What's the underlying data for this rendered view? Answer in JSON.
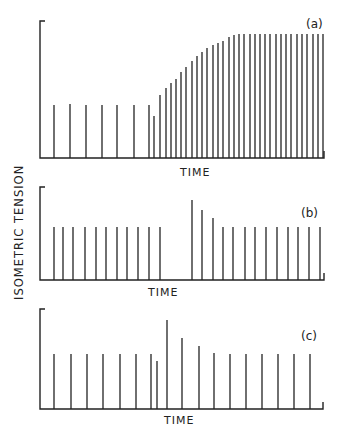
{
  "chart_data": {
    "type": "bar",
    "ylabel": "ISOMETRIC TENSION",
    "xlabel": "TIME",
    "grid": false,
    "panels": [
      {
        "label": "(a)",
        "xlabel": "TIME",
        "axis": {
          "x0": 40,
          "x1": 324,
          "baseline": 158,
          "top": 21
        },
        "label_pos": {
          "x": 306,
          "y": 28
        },
        "xlabel_pos": {
          "x": 180,
          "y": 176
        },
        "bars": [
          {
            "x": 54,
            "top": 105
          },
          {
            "x": 70,
            "top": 104
          },
          {
            "x": 86,
            "top": 105
          },
          {
            "x": 102,
            "top": 105
          },
          {
            "x": 117,
            "top": 105
          },
          {
            "x": 134,
            "top": 105
          },
          {
            "x": 149,
            "top": 105
          },
          {
            "x": 154,
            "top": 116
          },
          {
            "x": 160,
            "top": 95
          },
          {
            "x": 166,
            "top": 88
          },
          {
            "x": 171,
            "top": 83
          },
          {
            "x": 176,
            "top": 79
          },
          {
            "x": 181,
            "top": 72
          },
          {
            "x": 186,
            "top": 67
          },
          {
            "x": 192,
            "top": 61
          },
          {
            "x": 197,
            "top": 56
          },
          {
            "x": 202,
            "top": 52
          },
          {
            "x": 207,
            "top": 48
          },
          {
            "x": 213,
            "top": 45
          },
          {
            "x": 218,
            "top": 43
          },
          {
            "x": 223,
            "top": 41
          },
          {
            "x": 229,
            "top": 37
          },
          {
            "x": 234,
            "top": 35
          },
          {
            "x": 239,
            "top": 34
          },
          {
            "x": 244,
            "top": 34
          },
          {
            "x": 250,
            "top": 34
          },
          {
            "x": 255,
            "top": 34
          },
          {
            "x": 260,
            "top": 34
          },
          {
            "x": 265,
            "top": 34
          },
          {
            "x": 270,
            "top": 34
          },
          {
            "x": 276,
            "top": 34
          },
          {
            "x": 281,
            "top": 34
          },
          {
            "x": 286,
            "top": 34
          },
          {
            "x": 291,
            "top": 34
          },
          {
            "x": 297,
            "top": 34
          },
          {
            "x": 302,
            "top": 34
          },
          {
            "x": 307,
            "top": 34
          },
          {
            "x": 313,
            "top": 34
          },
          {
            "x": 318,
            "top": 34
          },
          {
            "x": 323,
            "top": 34
          }
        ],
        "relative_values": [
          1,
          1,
          1,
          1,
          1,
          1,
          1,
          0.79,
          1.19,
          1.32,
          1.42,
          1.49,
          1.62,
          1.72,
          1.83,
          1.92,
          2.0,
          2.08,
          2.13,
          2.17,
          2.21,
          2.28,
          2.32,
          2.34,
          2.34,
          2.34,
          2.34,
          2.34,
          2.34,
          2.34,
          2.34,
          2.34,
          2.34,
          2.34,
          2.34,
          2.34,
          2.34,
          2.34,
          2.34,
          2.34
        ]
      },
      {
        "label": "(b)",
        "xlabel": "TIME",
        "axis": {
          "x0": 40,
          "x1": 324,
          "baseline": 280,
          "top": 187
        },
        "label_pos": {
          "x": 301,
          "y": 217
        },
        "xlabel_pos": {
          "x": 148,
          "y": 296
        },
        "bars": [
          {
            "x": 54,
            "top": 227
          },
          {
            "x": 63,
            "top": 227
          },
          {
            "x": 73,
            "top": 227
          },
          {
            "x": 85,
            "top": 227
          },
          {
            "x": 96,
            "top": 227
          },
          {
            "x": 106,
            "top": 227
          },
          {
            "x": 117,
            "top": 227
          },
          {
            "x": 127,
            "top": 227
          },
          {
            "x": 138,
            "top": 227
          },
          {
            "x": 149,
            "top": 227
          },
          {
            "x": 160,
            "top": 227
          },
          {
            "x": 192,
            "top": 200
          },
          {
            "x": 202,
            "top": 210
          },
          {
            "x": 213,
            "top": 218
          },
          {
            "x": 223,
            "top": 227
          },
          {
            "x": 233,
            "top": 227
          },
          {
            "x": 245,
            "top": 227
          },
          {
            "x": 255,
            "top": 227
          },
          {
            "x": 266,
            "top": 227
          },
          {
            "x": 277,
            "top": 227
          },
          {
            "x": 288,
            "top": 227
          },
          {
            "x": 298,
            "top": 227
          },
          {
            "x": 309,
            "top": 227
          },
          {
            "x": 320,
            "top": 227
          }
        ],
        "relative_values": [
          1,
          1,
          1,
          1,
          1,
          1,
          1,
          1,
          1,
          1,
          1,
          1.51,
          1.32,
          1.17,
          1,
          1,
          1,
          1,
          1,
          1,
          1,
          1,
          1,
          1
        ]
      },
      {
        "label": "(c)",
        "xlabel": "TIME",
        "axis": {
          "x0": 40,
          "x1": 323,
          "baseline": 409,
          "top": 309
        },
        "label_pos": {
          "x": 301,
          "y": 340
        },
        "xlabel_pos": {
          "x": 164,
          "y": 424
        },
        "bars": [
          {
            "x": 54,
            "top": 354
          },
          {
            "x": 71,
            "top": 354
          },
          {
            "x": 87,
            "top": 354
          },
          {
            "x": 103,
            "top": 354
          },
          {
            "x": 120,
            "top": 354
          },
          {
            "x": 136,
            "top": 354
          },
          {
            "x": 151,
            "top": 354
          },
          {
            "x": 157,
            "top": 361
          },
          {
            "x": 167,
            "top": 320
          },
          {
            "x": 182,
            "top": 338
          },
          {
            "x": 199,
            "top": 346
          },
          {
            "x": 214,
            "top": 353
          },
          {
            "x": 230,
            "top": 354
          },
          {
            "x": 246,
            "top": 354
          },
          {
            "x": 262,
            "top": 354
          },
          {
            "x": 278,
            "top": 354
          },
          {
            "x": 294,
            "top": 354
          },
          {
            "x": 310,
            "top": 354
          }
        ],
        "relative_values": [
          1,
          1,
          1,
          1,
          1,
          1,
          1,
          0.87,
          1.62,
          1.29,
          1.15,
          1.02,
          1,
          1,
          1,
          1,
          1,
          1
        ]
      }
    ]
  }
}
